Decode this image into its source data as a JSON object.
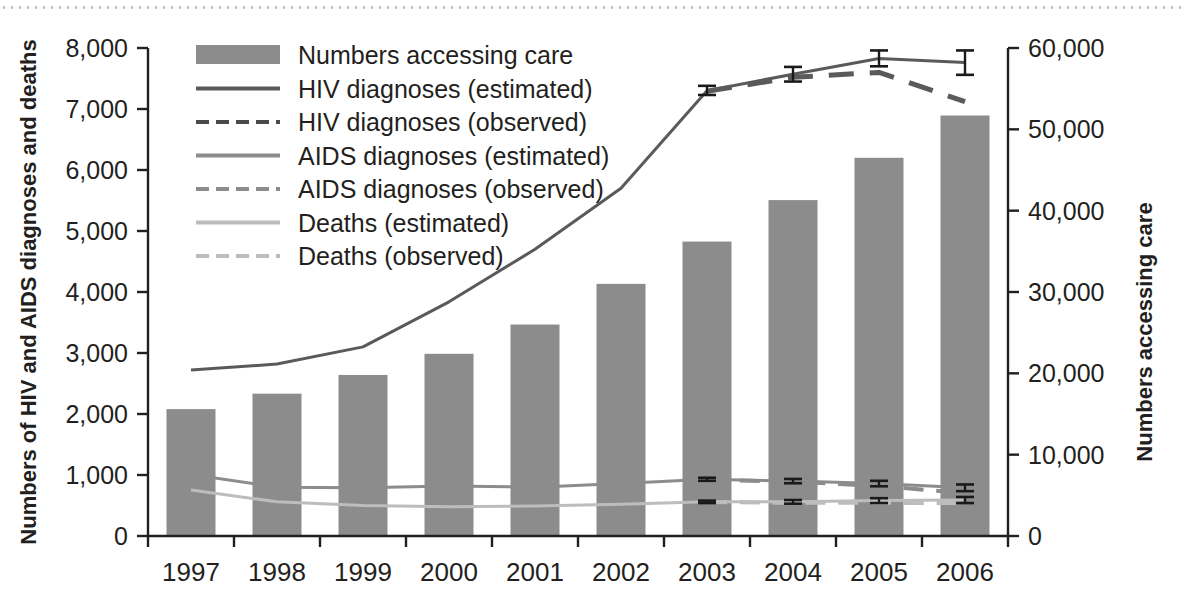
{
  "chart_data": {
    "type": "bar",
    "title": "",
    "subtitle": "",
    "categories": [
      "1997",
      "1998",
      "1999",
      "2000",
      "2001",
      "2002",
      "2003",
      "2004",
      "2005",
      "2006"
    ],
    "x": [
      1997,
      1998,
      1999,
      2000,
      2001,
      2002,
      2003,
      2004,
      2005,
      2006
    ],
    "xlabel": "",
    "ylabel": "Numbers of HIV and AIDS diagnoses and deaths",
    "ylabel_right": "Numbers accessing care",
    "ylim": [
      0,
      8000
    ],
    "ylim_right": [
      0,
      60000
    ],
    "yticks": [
      0,
      1000,
      2000,
      3000,
      4000,
      5000,
      6000,
      7000,
      8000
    ],
    "ytick_labels": [
      "0",
      "1,000",
      "2,000",
      "3,000",
      "4,000",
      "5,000",
      "6,000",
      "7,000",
      "8,000"
    ],
    "yticks_right": [
      0,
      10000,
      20000,
      30000,
      40000,
      50000,
      60000
    ],
    "ytick_labels_right": [
      "0",
      "10,000",
      "20,000",
      "30,000",
      "40,000",
      "50,000",
      "60,000"
    ],
    "grid": false,
    "legend_position": "top-left",
    "bars": {
      "name": "Numbers accessing care",
      "axis": "right",
      "color": "#8c8c8c",
      "values": [
        15600,
        17500,
        19800,
        22400,
        26000,
        31000,
        36200,
        41300,
        46500,
        51700
      ]
    },
    "series": [
      {
        "name": "HIV diagnoses (estimated)",
        "axis": "left",
        "style": "solid",
        "color": "#5a5a5a",
        "width": 3,
        "values": [
          2720,
          2820,
          3100,
          3840,
          4700,
          5700,
          7300,
          7570,
          7830,
          7760
        ],
        "errorbars": [
          {
            "x": 2003,
            "value": 7300,
            "low": 7230,
            "high": 7380
          },
          {
            "x": 2004,
            "value": 7570,
            "low": 7450,
            "high": 7690
          },
          {
            "x": 2005,
            "value": 7830,
            "low": 7700,
            "high": 7960
          },
          {
            "x": 2006,
            "value": 7760,
            "low": 7560,
            "high": 7960
          }
        ]
      },
      {
        "name": "HIV diagnoses (observed)",
        "axis": "left",
        "style": "dashed",
        "color": "#5a5a5a",
        "width": 5,
        "values": [
          null,
          null,
          null,
          null,
          null,
          null,
          7290,
          7520,
          7600,
          7120
        ]
      },
      {
        "name": "AIDS diagnoses (estimated)",
        "axis": "left",
        "style": "solid",
        "color": "#8c8c8c",
        "width": 3,
        "values": [
          1010,
          800,
          790,
          820,
          800,
          860,
          930,
          900,
          860,
          790
        ],
        "errorbars": [
          {
            "x": 2003,
            "value": 930,
            "low": 905,
            "high": 955
          },
          {
            "x": 2004,
            "value": 900,
            "low": 865,
            "high": 935
          },
          {
            "x": 2005,
            "value": 860,
            "low": 815,
            "high": 905
          },
          {
            "x": 2006,
            "value": 790,
            "low": 735,
            "high": 845
          }
        ]
      },
      {
        "name": "AIDS diagnoses (observed)",
        "axis": "left",
        "style": "dashed",
        "color": "#8c8c8c",
        "width": 4,
        "values": [
          null,
          null,
          null,
          null,
          null,
          null,
          925,
          890,
          820,
          700
        ]
      },
      {
        "name": "Deaths (estimated)",
        "axis": "left",
        "style": "solid",
        "color": "#bdbdbd",
        "width": 3,
        "values": [
          755,
          560,
          500,
          480,
          490,
          520,
          560,
          560,
          580,
          590
        ],
        "errorbars": [
          {
            "x": 2003,
            "value": 560,
            "low": 540,
            "high": 580
          },
          {
            "x": 2004,
            "value": 560,
            "low": 530,
            "high": 590
          },
          {
            "x": 2005,
            "value": 580,
            "low": 540,
            "high": 620
          },
          {
            "x": 2006,
            "value": 590,
            "low": 540,
            "high": 640
          }
        ]
      },
      {
        "name": "Deaths (observed)",
        "axis": "left",
        "style": "dashed",
        "color": "#bdbdbd",
        "width": 4,
        "values": [
          null,
          null,
          null,
          null,
          null,
          null,
          555,
          545,
          545,
          540
        ]
      }
    ],
    "legend": [
      {
        "label": "Numbers accessing care",
        "marker": "swatch",
        "color": "#8c8c8c"
      },
      {
        "label": "HIV diagnoses (estimated)",
        "marker": "solid-line",
        "color": "#5a5a5a"
      },
      {
        "label": "HIV diagnoses (observed)",
        "marker": "dashed-line",
        "color": "#4a4a4a"
      },
      {
        "label": "AIDS diagnoses (estimated)",
        "marker": "solid-line",
        "color": "#8c8c8c"
      },
      {
        "label": "AIDS diagnoses (observed)",
        "marker": "dashed-line",
        "color": "#8c8c8c"
      },
      {
        "label": "Deaths (estimated)",
        "marker": "solid-line",
        "color": "#bdbdbd"
      },
      {
        "label": "Deaths (observed)",
        "marker": "dashed-line",
        "color": "#bdbdbd"
      }
    ],
    "colors": {
      "bar": "#8c8c8c",
      "hiv": "#5a5a5a",
      "aids": "#8c8c8c",
      "deaths": "#bdbdbd",
      "axis": "#231f20",
      "text": "#231f20",
      "rule": "#b9b9bb"
    }
  }
}
